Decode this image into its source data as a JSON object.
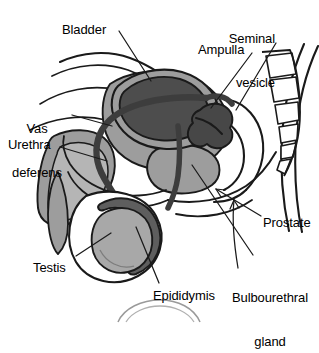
{
  "figure": {
    "background_color": "#ffffff",
    "line_color": "#1a1a1a",
    "fills": {
      "bladder": "#4d4d4d",
      "seminal_vesicle": "#474747",
      "epididymis": "#5e5e5e",
      "testis": "#a8a8a8",
      "soft_tissue": "#9d9d9d",
      "light_tissue": "#b5b5b5",
      "duct": "#3d3d3d",
      "white": "#ffffff"
    }
  },
  "labels": [
    {
      "id": "bladder",
      "text": "Bladder",
      "lines": [
        "Bladder"
      ],
      "align": "left",
      "x": 62,
      "y": 23
    },
    {
      "id": "seminal-vesicle",
      "text": "Seminal vesicle",
      "lines": [
        "Seminal",
        "vesicle"
      ],
      "align": "right",
      "x": 232,
      "y": 3
    },
    {
      "id": "ampulla",
      "text": "Ampulla",
      "lines": [
        "Ampulla"
      ],
      "align": "left",
      "x": 198,
      "y": 43
    },
    {
      "id": "vas-deferens",
      "text": "Vas deferens",
      "lines": [
        "Vas",
        "deferens"
      ],
      "align": "center",
      "x": 6,
      "y": 93
    },
    {
      "id": "urethra",
      "text": "Urethra",
      "lines": [
        "Urethra"
      ],
      "align": "left",
      "x": 8,
      "y": 138
    },
    {
      "id": "prostate",
      "text": "Prostate",
      "lines": [
        "Prostate"
      ],
      "align": "left",
      "x": 263,
      "y": 216
    },
    {
      "id": "bulbourethral-gland",
      "text": "Bulbourethral gland",
      "lines": [
        "Bulbourethral",
        "gland"
      ],
      "align": "center",
      "x": 228,
      "y": 262
    },
    {
      "id": "testis",
      "text": "Testis",
      "lines": [
        "Testis"
      ],
      "align": "left",
      "x": 33,
      "y": 261
    },
    {
      "id": "epididymis",
      "text": "Epididymis",
      "lines": [
        "Epididymis"
      ],
      "align": "left",
      "x": 153,
      "y": 289
    }
  ],
  "leaders": [
    {
      "id": "bladder-leader",
      "points": "119,31 151,81"
    },
    {
      "id": "seminal-vesicle-leader",
      "points": "276,43 236,110"
    },
    {
      "id": "ampulla-leader",
      "points": "252,53 211,108"
    },
    {
      "id": "vas-deferens-leader",
      "points": "72,115 112,126"
    },
    {
      "id": "urethra-leader",
      "points": "60,147 107,161"
    },
    {
      "id": "prostate-leader",
      "points": "261,216 217,190"
    },
    {
      "id": "bulbourethral-leader",
      "points": "253,255 192,165"
    },
    {
      "id": "testis-leader",
      "points": "76,256 111,233"
    },
    {
      "id": "epididymis-leader",
      "points": "159,283 136,227"
    }
  ],
  "structures": [
    {
      "id": "bladder",
      "name": "Bladder"
    },
    {
      "id": "seminal-vesicle",
      "name": "Seminal vesicle"
    },
    {
      "id": "ampulla",
      "name": "Ampulla of vas deferens"
    },
    {
      "id": "vas-deferens",
      "name": "Vas deferens"
    },
    {
      "id": "urethra",
      "name": "Urethra"
    },
    {
      "id": "prostate",
      "name": "Prostate"
    },
    {
      "id": "bulbourethral-gland",
      "name": "Bulbourethral gland"
    },
    {
      "id": "testis",
      "name": "Testis"
    },
    {
      "id": "epididymis",
      "name": "Epididymis"
    },
    {
      "id": "sacrum",
      "name": "Sacrum and coccyx vertebrae",
      "segments": 6
    },
    {
      "id": "penis",
      "name": "Penis shaft"
    },
    {
      "id": "scrotum",
      "name": "Scrotum"
    }
  ]
}
